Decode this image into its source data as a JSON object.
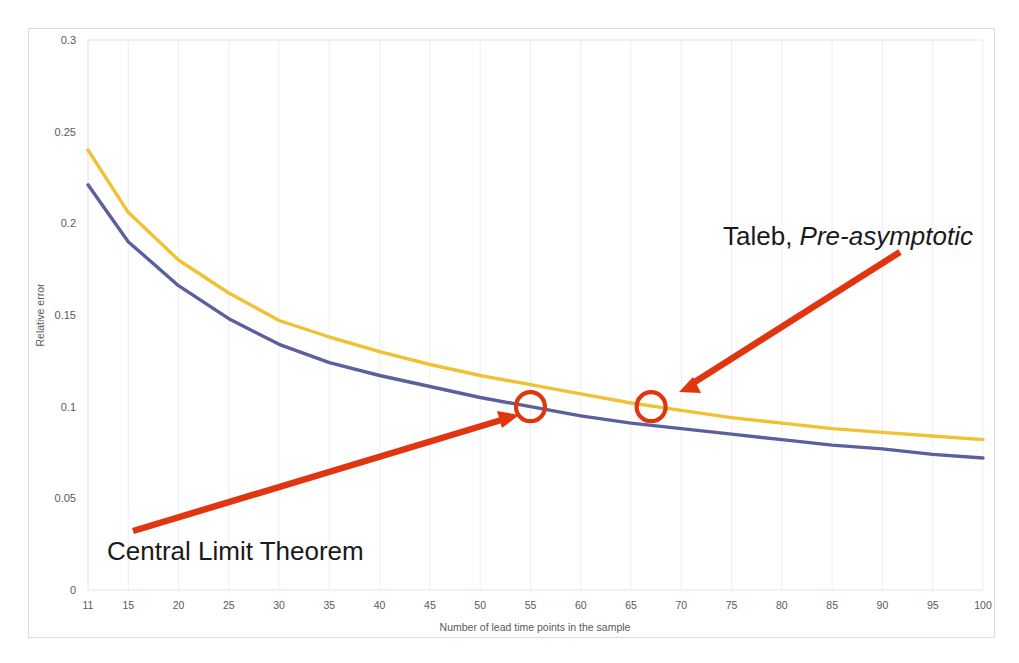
{
  "chart_data": {
    "type": "line",
    "title": "",
    "xlabel": "Number of lead time points in the sample",
    "ylabel": "Relative error",
    "xlim": [
      11,
      100
    ],
    "ylim": [
      0,
      0.3
    ],
    "y_ticks": [
      "0",
      "0.05",
      "0.1",
      "0.15",
      "0.2",
      "0.25",
      "0.3"
    ],
    "y_tick_values": [
      0,
      0.05,
      0.1,
      0.15,
      0.2,
      0.25,
      0.3
    ],
    "x_ticks": [
      "11",
      "15",
      "20",
      "25",
      "30",
      "35",
      "40",
      "45",
      "50",
      "55",
      "60",
      "65",
      "70",
      "75",
      "80",
      "85",
      "90",
      "95",
      "100"
    ],
    "x_tick_values": [
      11,
      15,
      20,
      25,
      30,
      35,
      40,
      45,
      50,
      55,
      60,
      65,
      70,
      75,
      80,
      85,
      90,
      95,
      100
    ],
    "grid": "vertical-faint",
    "legend": "none",
    "x": [
      11,
      15,
      20,
      25,
      30,
      35,
      40,
      45,
      50,
      55,
      60,
      65,
      70,
      75,
      80,
      85,
      90,
      95,
      100
    ],
    "series": [
      {
        "name": "Taleb, Pre-asymptotic",
        "color": "#f0c233",
        "values": [
          0.24,
          0.206,
          0.18,
          0.162,
          0.147,
          0.138,
          0.13,
          0.123,
          0.117,
          0.112,
          0.107,
          0.102,
          0.098,
          0.094,
          0.091,
          0.088,
          0.086,
          0.084,
          0.082
        ]
      },
      {
        "name": "Central Limit Theorem",
        "color": "#5b5f9e",
        "values": [
          0.221,
          0.19,
          0.166,
          0.148,
          0.134,
          0.124,
          0.117,
          0.111,
          0.105,
          0.1,
          0.095,
          0.091,
          0.088,
          0.085,
          0.082,
          0.079,
          0.077,
          0.074,
          0.072
        ]
      }
    ],
    "markers": [
      {
        "label": "clt-marker",
        "x": 55,
        "y": 0.1,
        "series": "Central Limit Theorem",
        "shape": "circle-outline",
        "color": "#e0350f"
      },
      {
        "label": "taleb-marker",
        "x": 67,
        "y": 0.1,
        "series": "Taleb, Pre-asymptotic",
        "shape": "circle-outline",
        "color": "#e0350f"
      }
    ],
    "annotations": [
      {
        "id": "taleb",
        "text_plain": "Taleb, ",
        "text_emphasis": "Pre-asymptotic",
        "arrow_color": "#e0350f",
        "points_to": "taleb-marker"
      },
      {
        "id": "clt",
        "text_plain": "Central Limit Theorem",
        "text_emphasis": "",
        "arrow_color": "#e0350f",
        "points_to": "clt-marker"
      }
    ],
    "colors": {
      "taleb_curve": "#f0c233",
      "clt_curve": "#5b5f9e",
      "annotation": "#e0350f",
      "grid": "#eeeef1",
      "frame": "#dcdcdc",
      "tick_text": "#59595b"
    }
  }
}
